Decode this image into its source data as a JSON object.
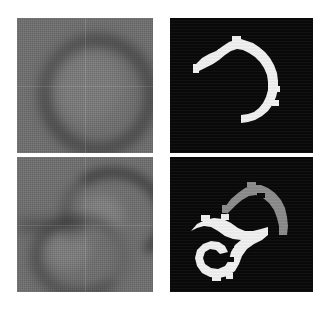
{
  "figure": {
    "background_color": "#ffffff",
    "layout": "2x2 grid",
    "columns": [
      "input grayscale scan",
      "binary segmentation mask"
    ],
    "rows": [
      "case 1 (single structure)",
      "case 2 (two structures)"
    ]
  },
  "panels": [
    {
      "id": "top-left",
      "kind": "grayscale-scan",
      "caption": "",
      "description": "Blurred grayscale scan showing a single dark ring-shaped structure near the centre",
      "background_color": "#6f6f6f",
      "structure_color": "#262626",
      "x": 17,
      "y": 18,
      "width": 136,
      "height": 135
    },
    {
      "id": "top-right",
      "kind": "binary-mask",
      "caption": "",
      "description": "Binary mask: one white C-shaped (open crescent) region on black background",
      "background_color": "#090909",
      "region_colors": [
        "#f2f2f2"
      ],
      "region_count": 1,
      "x": 169,
      "y": 18,
      "width": 144,
      "height": 135
    },
    {
      "id": "bottom-left",
      "kind": "grayscale-scan",
      "caption": "",
      "description": "Blurred grayscale scan showing two dark curved structures: an upper arc and a lower ring",
      "background_color": "#6f6f6f",
      "structure_color": "#262626",
      "x": 17,
      "y": 157,
      "width": 136,
      "height": 135
    },
    {
      "id": "bottom-right",
      "kind": "binary-mask",
      "caption": "",
      "description": "Binary mask: an upper gray crescent region and a lower white spiral/hook region on black background",
      "background_color": "#090909",
      "region_colors": [
        "#8d8d8d",
        "#f2f2f2"
      ],
      "region_count": 2,
      "x": 169,
      "y": 157,
      "width": 144,
      "height": 135
    }
  ],
  "colors": {
    "page_background": "#ffffff",
    "scan_background": "#6f6f6f",
    "mask_background": "#090909",
    "mask_white": "#f2f2f2",
    "mask_gray": "#8d8d8d",
    "scan_structure": "#262626"
  }
}
